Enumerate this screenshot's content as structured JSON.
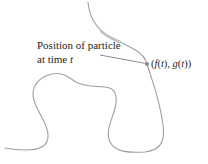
{
  "diagram": {
    "annotation": {
      "line1": "Position of particle",
      "line2_prefix": "at time ",
      "line2_var": "t"
    },
    "point_label": {
      "open": "(",
      "f": "f",
      "t1_open": "(",
      "t1": "t",
      "t1_close": "), ",
      "g": "g",
      "t2_open": "(",
      "t2": "t",
      "t2_close": "))"
    },
    "colors": {
      "curve": "#9d9fa2",
      "highlight": "#bfc1c3",
      "point": "#8a8c8e",
      "leader": "#6d6e71",
      "text": "#231f20"
    }
  }
}
